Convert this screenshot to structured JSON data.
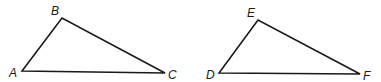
{
  "figure": {
    "triangles": [
      {
        "name": "ABC",
        "vertices": [
          {
            "label": "A",
            "x": 22,
            "y": 71,
            "lx": 9,
            "ly": 77
          },
          {
            "label": "B",
            "x": 62,
            "y": 18,
            "lx": 51,
            "ly": 15
          },
          {
            "label": "C",
            "x": 165,
            "y": 73,
            "lx": 168,
            "ly": 79
          }
        ]
      },
      {
        "name": "DEF",
        "vertices": [
          {
            "label": "D",
            "x": 219,
            "y": 73,
            "lx": 206,
            "ly": 79
          },
          {
            "label": "E",
            "x": 258,
            "y": 20,
            "lx": 247,
            "ly": 17
          },
          {
            "label": "F",
            "x": 360,
            "y": 74,
            "lx": 363,
            "ly": 80
          }
        ]
      }
    ]
  }
}
